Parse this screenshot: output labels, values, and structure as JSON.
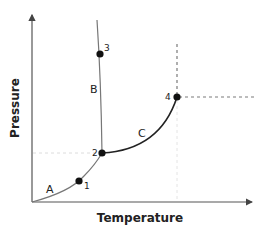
{
  "diagram": {
    "type": "phase_diagram",
    "x_axis_label": "Temperature",
    "y_axis_label": "Pressure",
    "regions": [
      {
        "id": "A",
        "label": "A"
      },
      {
        "id": "B",
        "label": "B"
      },
      {
        "id": "C",
        "label": "C"
      }
    ],
    "points": [
      {
        "id": "1",
        "label": "1"
      },
      {
        "id": "2",
        "label": "2"
      },
      {
        "id": "3",
        "label": "3"
      },
      {
        "id": "4",
        "label": "4"
      }
    ],
    "colors": {
      "axis": "#555555",
      "curve_thin": "#777777",
      "curve_bold": "#222222",
      "point": "#111111",
      "dashed_strong": "#777777",
      "dashed_faint": "#dddddd"
    }
  }
}
